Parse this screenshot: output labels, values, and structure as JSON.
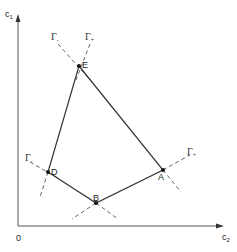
{
  "axes": {
    "y_label": "c",
    "y_label_sub": "1",
    "x_label": "c",
    "x_label_sub": "2",
    "origin_label": "0"
  },
  "points": [
    {
      "name": "E",
      "label": "E"
    },
    {
      "name": "A",
      "label": "A"
    },
    {
      "name": "B",
      "label": "B"
    },
    {
      "name": "D",
      "label": "D"
    }
  ],
  "polygon_order": [
    "E",
    "A",
    "B",
    "D"
  ],
  "gamma_labels": {
    "top_minus": {
      "text": "Γ",
      "sub": "-"
    },
    "top_plus": {
      "text": "Γ",
      "sub": "+"
    },
    "left_minus": {
      "text": "Γ",
      "sub": "-"
    },
    "right_plus": {
      "text": "Γ",
      "sub": "+"
    }
  },
  "colors": {
    "line": "#333333",
    "dashed": "#555555",
    "axis": "#555555"
  }
}
